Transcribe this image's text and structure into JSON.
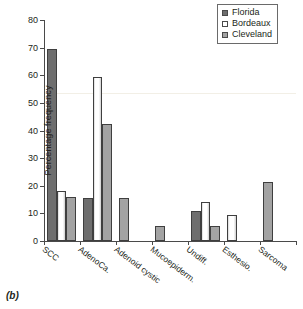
{
  "caption": "(b)",
  "legend": {
    "position": "top-right",
    "entries": [
      {
        "label": "Florida",
        "color": "#6e6e6e",
        "key": "florida"
      },
      {
        "label": "Bordeaux",
        "color": "#ffffff",
        "key": "bordeaux"
      },
      {
        "label": "Cleveland",
        "color": "#a3a3a3",
        "key": "cleveland"
      }
    ]
  },
  "chart_data": {
    "type": "bar",
    "title": "",
    "xlabel": "",
    "ylabel": "Percentage frequency",
    "ylim": [
      0,
      80
    ],
    "yticks": [
      0,
      10,
      20,
      30,
      40,
      50,
      60,
      70,
      80
    ],
    "grid": false,
    "categories": [
      "SCC",
      "AdenoCa.",
      "Adenoid cystic",
      "Mucoepiderm.",
      "Undiff.",
      "Esthesio.",
      "Sarcoma"
    ],
    "series": [
      {
        "name": "Florida",
        "color": "#6e6e6e",
        "values": [
          69.5,
          15.5,
          0,
          0,
          10.9,
          0,
          0
        ]
      },
      {
        "name": "Bordeaux",
        "color": "#ffffff",
        "values": [
          18.0,
          59.3,
          0,
          0,
          14.0,
          9.5,
          0
        ]
      },
      {
        "name": "Cleveland",
        "color": "#a3a3a3",
        "values": [
          15.8,
          42.2,
          15.5,
          5.5,
          5.5,
          0,
          21.3
        ]
      }
    ]
  }
}
